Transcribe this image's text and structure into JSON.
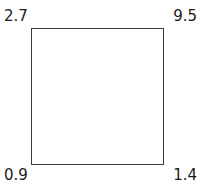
{
  "diagram": {
    "type": "square-outline-with-corner-labels",
    "background_color": "#ffffff",
    "shape": {
      "name": "square",
      "stroke_color": "#3b3b3b",
      "stroke_width": 1,
      "fill": "none"
    },
    "labels": {
      "top_left": "2.7",
      "top_right": "9.5",
      "bottom_left": "0.9",
      "bottom_right": "1.4"
    },
    "label_color": "#1a1a1a"
  }
}
